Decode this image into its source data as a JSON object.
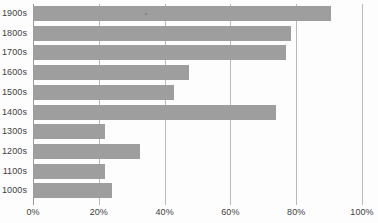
{
  "chart_data": {
    "type": "bar",
    "orientation": "horizontal",
    "title": "",
    "subtitle": "",
    "xlabel": "",
    "ylabel": "",
    "categories": [
      "1900s",
      "1800s",
      "1700s",
      "1600s",
      "1500s",
      "1400s",
      "1300s",
      "1200s",
      "1100s",
      "1000s"
    ],
    "values": [
      90.5,
      78.5,
      77,
      47.5,
      43,
      74,
      22,
      32.5,
      22,
      24
    ],
    "value_unit": "%",
    "xlim": [
      0,
      100
    ],
    "xticks": [
      0,
      20,
      40,
      60,
      80,
      100
    ],
    "xtick_labels": [
      "0%",
      "20%",
      "40%",
      "60%",
      "80%",
      "100%"
    ],
    "grid": true,
    "grid_axis": "x",
    "legend": false,
    "legend_position": "none",
    "series": [
      {
        "name": "",
        "color": "#9e9e9e",
        "values": [
          90.5,
          78.5,
          77,
          47.5,
          43,
          74,
          22,
          32.5,
          22,
          24
        ]
      }
    ]
  },
  "colors": {
    "bar": "#9e9e9e",
    "gridline": "#b9b9b9",
    "axis": "#9a9a9a",
    "text": "#3f3f3f",
    "background": "#fdfdfd"
  }
}
